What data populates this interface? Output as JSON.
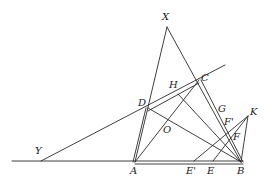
{
  "diagram": {
    "type": "geometric-construction",
    "stroke_color": "#2a2a2a",
    "labels": [
      {
        "id": "X",
        "text": "X",
        "x": 162,
        "y": 12
      },
      {
        "id": "C",
        "text": "C",
        "x": 201,
        "y": 73
      },
      {
        "id": "H",
        "text": "H",
        "x": 169,
        "y": 80
      },
      {
        "id": "D",
        "text": "D",
        "x": 138,
        "y": 98
      },
      {
        "id": "G",
        "text": "G",
        "x": 218,
        "y": 104
      },
      {
        "id": "K",
        "text": "K",
        "x": 250,
        "y": 107
      },
      {
        "id": "F'",
        "text": "F'",
        "x": 224,
        "y": 117
      },
      {
        "id": "O",
        "text": "O",
        "x": 163,
        "y": 125
      },
      {
        "id": "F",
        "text": "F",
        "x": 233,
        "y": 132
      },
      {
        "id": "Y",
        "text": "Y",
        "x": 35,
        "y": 146
      },
      {
        "id": "A",
        "text": "A",
        "x": 130,
        "y": 166
      },
      {
        "id": "E'",
        "text": "E'",
        "x": 186,
        "y": 166
      },
      {
        "id": "E",
        "text": "E",
        "x": 207,
        "y": 166
      },
      {
        "id": "B",
        "text": "B",
        "x": 237,
        "y": 166
      }
    ],
    "points": {
      "X": [
        167,
        27
      ],
      "A": [
        135,
        162
      ],
      "B": [
        241,
        162
      ],
      "C": [
        199,
        80
      ],
      "D": [
        148,
        108
      ],
      "Y": [
        41,
        161
      ],
      "H": [
        178,
        94
      ],
      "O": [
        166,
        124
      ],
      "G": [
        218,
        110
      ],
      "K": [
        248,
        116
      ],
      "Fp": [
        227,
        124
      ],
      "F": [
        232,
        138
      ],
      "Ep": [
        194,
        162
      ],
      "E": [
        213,
        162
      ],
      "RayEnd": [
        225,
        65
      ],
      "BaseLeft": [
        12,
        161
      ]
    }
  }
}
